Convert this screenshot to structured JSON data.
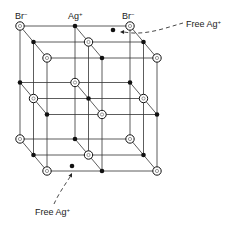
{
  "diagram": {
    "type": "crystal-lattice",
    "colors": {
      "line": "#333333",
      "ion": "#111111",
      "background": "#ffffff"
    },
    "grid": {
      "origin": [
        20,
        26
      ],
      "col_step": 55,
      "layer_step": 56.5,
      "depth_step": [
        13.5,
        16
      ],
      "size": [
        3,
        3,
        3
      ]
    },
    "ions": {
      "br": {
        "symbol": "Br",
        "charge": "−",
        "glyph": "open-circle"
      },
      "ag": {
        "symbol": "Ag",
        "charge": "+",
        "glyph": "filled-dot"
      }
    },
    "top_labels": [
      {
        "text": "Br",
        "sup": "−",
        "x": 15,
        "y": 19
      },
      {
        "text": "Ag",
        "sup": "+",
        "x": 68,
        "y": 19
      },
      {
        "text": "Br",
        "sup": "−",
        "x": 122,
        "y": 19
      }
    ],
    "free_ions": [
      {
        "label": "Free Ag",
        "sup": "+",
        "dot": [
          113,
          30
        ],
        "label_pos": [
          186,
          27
        ],
        "arrow_path": "M183,23 C165,28 145,36 124,32",
        "arrow_tip": [
          120,
          32
        ]
      },
      {
        "label": "Free Ag",
        "sup": "+",
        "dot": [
          72,
          166
        ],
        "label_pos": [
          35,
          215
        ],
        "arrow_path": "M54,204 C58,195 64,186 70,177",
        "arrow_tip": [
          72,
          173
        ]
      }
    ]
  }
}
